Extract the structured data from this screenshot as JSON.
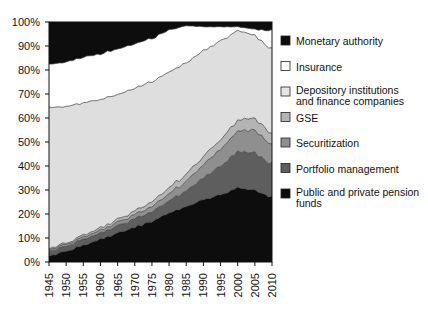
{
  "chart_data": {
    "type": "area",
    "title": "",
    "subtitle": "",
    "xlabel": "",
    "ylabel": "",
    "stacked": true,
    "normalized": true,
    "grid": false,
    "legend_position": "right",
    "xlim": [
      1945,
      2010
    ],
    "ylim": [
      0,
      100
    ],
    "x_tick_labels": [
      "1945",
      "1950",
      "1955",
      "1960",
      "1965",
      "1970",
      "1975",
      "1980",
      "1985",
      "1990",
      "1995",
      "2000",
      "2005",
      "2010"
    ],
    "y_tick_labels": [
      "0%",
      "10%",
      "20%",
      "30%",
      "40%",
      "50%",
      "60%",
      "70%",
      "80%",
      "90%",
      "100%"
    ],
    "y_tick_values": [
      0,
      10,
      20,
      30,
      40,
      50,
      60,
      70,
      80,
      90,
      100
    ],
    "x": [
      1945,
      1950,
      1955,
      1960,
      1965,
      1970,
      1975,
      1980,
      1985,
      1990,
      1995,
      2000,
      2005,
      2010
    ],
    "series": [
      {
        "name": "Public and private pension funds",
        "color": "#0d0d0d",
        "stack_order": 1,
        "values": [
          2.5,
          4.5,
          7.0,
          9.5,
          12.0,
          14.5,
          17.0,
          20.5,
          23.0,
          26.0,
          28.0,
          31.0,
          30.0,
          27.0
        ]
      },
      {
        "name": "Portfolio management",
        "color": "#5e5e5e",
        "stack_order": 2,
        "values": [
          2.0,
          2.0,
          2.5,
          2.5,
          3.0,
          3.5,
          4.0,
          5.0,
          6.5,
          9.0,
          12.0,
          15.0,
          15.5,
          13.5
        ]
      },
      {
        "name": "Securitization",
        "color": "#8f8f8f",
        "stack_order": 3,
        "values": [
          0.8,
          0.8,
          1.0,
          1.2,
          1.5,
          1.8,
          2.2,
          3.0,
          4.0,
          5.5,
          7.0,
          8.5,
          9.5,
          8.0
        ]
      },
      {
        "name": "GSE",
        "color": "#b4b4b4",
        "stack_order": 4,
        "values": [
          0.5,
          0.5,
          0.8,
          1.0,
          1.2,
          1.5,
          2.0,
          2.5,
          3.0,
          3.5,
          4.0,
          4.5,
          5.0,
          4.5
        ]
      },
      {
        "name": "Depository institutions and finance companies",
        "color": "#dedede",
        "stack_order": 5,
        "values": [
          58.5,
          57.0,
          55.0,
          53.5,
          52.0,
          51.0,
          50.0,
          48.0,
          46.5,
          44.0,
          41.0,
          37.5,
          34.5,
          35.5
        ]
      },
      {
        "name": "Insurance",
        "color": "#ffffff",
        "stack_order": 6,
        "values": [
          18.0,
          18.5,
          19.0,
          19.0,
          19.0,
          18.5,
          18.0,
          17.5,
          15.5,
          10.0,
          6.0,
          1.5,
          2.5,
          8.0
        ]
      },
      {
        "name": "Monetary authority",
        "color": "#0d0d0d",
        "stack_order": 7,
        "values": [
          17.7,
          16.7,
          14.7,
          13.3,
          11.3,
          9.2,
          6.8,
          3.5,
          1.5,
          2.0,
          2.0,
          2.0,
          3.0,
          3.5
        ]
      }
    ]
  },
  "legend": {
    "items": [
      {
        "label": "Monetary authority",
        "color": "#0d0d0d"
      },
      {
        "label": "Insurance",
        "color": "#ffffff"
      },
      {
        "label": "Depository institutions",
        "label2": "and finance companies",
        "color": "#e6e6e6"
      },
      {
        "label": "GSE",
        "color": "#b4b4b4"
      },
      {
        "label": "Securitization",
        "color": "#8f8f8f"
      },
      {
        "label": "Portfolio management",
        "color": "#5e5e5e"
      },
      {
        "label": "Public and private pension",
        "label2": "funds",
        "color": "#0d0d0d"
      }
    ]
  }
}
